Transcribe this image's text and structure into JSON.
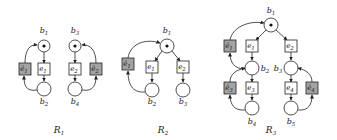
{
  "colors": {
    "stroke": "#222222",
    "grey_event": "#a3a3a3",
    "background": "#ffffff"
  },
  "nets": [
    {
      "caption": "R1",
      "conditions": [
        {
          "id": "b1",
          "label": "b",
          "sub": "1",
          "x": 44,
          "y": 46,
          "r": 6,
          "marked": true,
          "lx": 44,
          "ly": 33
        },
        {
          "id": "b2",
          "label": "b",
          "sub": "2",
          "x": 44,
          "y": 89,
          "r": 7,
          "marked": false,
          "lx": 44,
          "ly": 104
        },
        {
          "id": "b3",
          "label": "b",
          "sub": "3",
          "x": 75,
          "y": 46,
          "r": 6,
          "marked": true,
          "lx": 75,
          "ly": 33
        },
        {
          "id": "b4",
          "label": "b",
          "sub": "4",
          "x": 75,
          "y": 89,
          "r": 7,
          "marked": false,
          "lx": 75,
          "ly": 104
        }
      ],
      "events": [
        {
          "id": "e1",
          "label": "e",
          "sub": "1",
          "x": 44,
          "y": 69,
          "grey": false
        },
        {
          "id": "e1bar",
          "label": "ē",
          "sub": "1",
          "x": 25,
          "y": 69,
          "grey": true
        },
        {
          "id": "e2",
          "label": "e",
          "sub": "2",
          "x": 75,
          "y": 69,
          "grey": false
        },
        {
          "id": "e2bar",
          "label": "ē",
          "sub": "2",
          "x": 96,
          "y": 69,
          "grey": true
        }
      ],
      "caption_pos": {
        "x": 59,
        "y": 133
      }
    },
    {
      "caption": "R2",
      "conditions": [
        {
          "id": "b1",
          "label": "b",
          "sub": "1",
          "x": 167,
          "y": 46,
          "r": 7,
          "marked": true,
          "lx": 167,
          "ly": 33
        },
        {
          "id": "b2",
          "label": "b",
          "sub": "2",
          "x": 152,
          "y": 90,
          "r": 7,
          "marked": false,
          "lx": 152,
          "ly": 104
        },
        {
          "id": "b3",
          "label": "b",
          "sub": "3",
          "x": 183,
          "y": 90,
          "r": 7,
          "marked": false,
          "lx": 183,
          "ly": 104
        }
      ],
      "events": [
        {
          "id": "e1bar",
          "label": "ē",
          "sub": "1",
          "x": 128,
          "y": 64,
          "grey": true
        },
        {
          "id": "e1",
          "label": "e",
          "sub": "1",
          "x": 152,
          "y": 67,
          "grey": false
        },
        {
          "id": "e2",
          "label": "e",
          "sub": "2",
          "x": 183,
          "y": 67,
          "grey": false
        }
      ],
      "caption_pos": {
        "x": 163,
        "y": 133
      }
    },
    {
      "caption": "R3",
      "conditions": [
        {
          "id": "b1",
          "label": "b",
          "sub": "1",
          "x": 271,
          "y": 25,
          "r": 7,
          "marked": true,
          "lx": 271,
          "ly": 13
        },
        {
          "id": "b2",
          "label": "b",
          "sub": "2",
          "x": 252,
          "y": 68,
          "r": 7,
          "marked": false,
          "lx": 265,
          "ly": 71
        },
        {
          "id": "b3",
          "label": "b",
          "sub": "3",
          "x": 291,
          "y": 68,
          "r": 7,
          "marked": false,
          "lx": 278,
          "ly": 71
        },
        {
          "id": "b4",
          "label": "b",
          "sub": "4",
          "x": 252,
          "y": 108,
          "r": 7,
          "marked": false,
          "lx": 252,
          "ly": 124
        },
        {
          "id": "b5",
          "label": "b",
          "sub": "5",
          "x": 291,
          "y": 108,
          "r": 7,
          "marked": false,
          "lx": 291,
          "ly": 124
        }
      ],
      "events": [
        {
          "id": "e1bar",
          "label": "ē",
          "sub": "1",
          "x": 230,
          "y": 46,
          "grey": true
        },
        {
          "id": "e1",
          "label": "e",
          "sub": "1",
          "x": 252,
          "y": 46,
          "grey": false
        },
        {
          "id": "e2",
          "label": "e",
          "sub": "2",
          "x": 291,
          "y": 46,
          "grey": false
        },
        {
          "id": "e3bar",
          "label": "ē",
          "sub": "3",
          "x": 230,
          "y": 88,
          "grey": true
        },
        {
          "id": "e3",
          "label": "e",
          "sub": "3",
          "x": 252,
          "y": 88,
          "grey": false
        },
        {
          "id": "e4",
          "label": "e",
          "sub": "4",
          "x": 291,
          "y": 88,
          "grey": false
        },
        {
          "id": "e4bar",
          "label": "ē",
          "sub": "4",
          "x": 312,
          "y": 88,
          "grey": true
        }
      ],
      "caption_pos": {
        "x": 271,
        "y": 133
      }
    }
  ]
}
